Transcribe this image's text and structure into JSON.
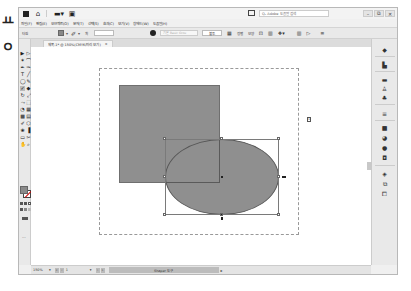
{
  "outside": {
    "top_glyph": "ㅛ",
    "mid_glyph": "ㅇ"
  },
  "titlebar": {
    "app_icon": "ai-logo-icon",
    "home_icon": "home-icon",
    "workspace_icon": "workspace-switcher-icon",
    "arrange_icon": "arrange-documents-icon",
    "search_placeholder": "Qᵥ Adobe 도움말 검색",
    "window_buttons": [
      "–",
      "⧉",
      "✕"
    ]
  },
  "menubar": {
    "items": [
      "파일(F)",
      "편집(E)",
      "오브젝트(O)",
      "문자(T)",
      "선택(S)",
      "효과(C)",
      "보기(V)",
      "창에드(W)",
      "도움말(H)"
    ]
  },
  "controlbar": {
    "object_label": "타원",
    "fill_dropdown": "▾",
    "stroke_dropdown": "▾",
    "stroke_weight_label": "획",
    "stroke_weight_value": "",
    "style_placeholder": "기본 Basic Grou",
    "opacity_label": "불투",
    "shape_button": "모양",
    "align_label": "정렬",
    "transform_label": "변형",
    "other_icons": [
      "align-icon",
      "transform-icon",
      "isolate-icon",
      "arrange-icon",
      "launch-icon",
      "menu-icon"
    ]
  },
  "document_tab": {
    "title": "제목-1* @ 150%(CMYK/미리 보기)",
    "close": "×"
  },
  "tools": [
    {
      "name": "selection-tool",
      "glyph": "▶"
    },
    {
      "name": "direct-selection-tool",
      "glyph": "▷"
    },
    {
      "name": "magic-wand-tool",
      "glyph": "✶"
    },
    {
      "name": "lasso-tool",
      "glyph": "⌒"
    },
    {
      "name": "pen-tool",
      "glyph": "✒"
    },
    {
      "name": "curvature-tool",
      "glyph": "✑"
    },
    {
      "name": "type-tool",
      "glyph": "T"
    },
    {
      "name": "line-tool",
      "glyph": "╱"
    },
    {
      "name": "ellipse-tool",
      "glyph": "◯"
    },
    {
      "name": "paintbrush-tool",
      "glyph": "✎"
    },
    {
      "name": "shaper-tool",
      "glyph": "✓"
    },
    {
      "name": "eraser-tool",
      "glyph": "◆"
    },
    {
      "name": "rotate-tool",
      "glyph": "↻"
    },
    {
      "name": "scale-tool",
      "glyph": "⤢"
    },
    {
      "name": "width-tool",
      "glyph": "⤳"
    },
    {
      "name": "free-transform-tool",
      "glyph": "⬚"
    },
    {
      "name": "shape-builder-tool",
      "glyph": "◔"
    },
    {
      "name": "perspective-grid-tool",
      "glyph": "▦"
    },
    {
      "name": "mesh-tool",
      "glyph": "▩"
    },
    {
      "name": "gradient-tool",
      "glyph": "▤"
    },
    {
      "name": "eyedropper-tool",
      "glyph": "✐"
    },
    {
      "name": "blend-tool",
      "glyph": "⬡"
    },
    {
      "name": "symbol-sprayer-tool",
      "glyph": "❀"
    },
    {
      "name": "column-graph-tool",
      "glyph": "▐"
    },
    {
      "name": "artboard-tool",
      "glyph": "▭"
    },
    {
      "name": "slice-tool",
      "glyph": "✂"
    },
    {
      "name": "hand-tool",
      "glyph": "✋"
    },
    {
      "name": "zoom-tool",
      "glyph": "⌕"
    }
  ],
  "fill_stroke": {
    "fill_color": "#8a8a8a",
    "stroke_color": "none"
  },
  "toolbar_more": "···",
  "canvas": {
    "shape_fill": "#8f8f8f",
    "artboard_number": "1"
  },
  "right_panel": {
    "icons": [
      "color-icon",
      "color-guide-icon",
      "swatches-icon",
      "brushes-icon",
      "symbols-icon",
      "stroke-icon",
      "gradient-icon",
      "transparency-icon",
      "appearance-icon",
      "graphic-styles-icon",
      "layers-icon",
      "artboards-icon",
      "asset-export-icon"
    ]
  },
  "statusbar": {
    "zoom": "150%",
    "zoom_dropdown": "▾",
    "nav_first": "«",
    "nav_prev": "‹",
    "page": "1",
    "page_dropdown": "▾",
    "nav_next": "›",
    "nav_last": "»",
    "tool_name": "Shaper 도구",
    "arrow": "▸"
  }
}
